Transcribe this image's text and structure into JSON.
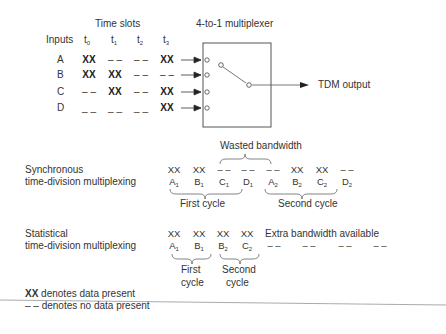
{
  "top": {
    "time_slots_label": "Time slots",
    "inputs_label": "Inputs",
    "mux_label": "4-to-1 multiplexer",
    "output_label": "TDM output",
    "slots": [
      {
        "base": "t",
        "sub": "0"
      },
      {
        "base": "t",
        "sub": "1"
      },
      {
        "base": "t",
        "sub": "2"
      },
      {
        "base": "t",
        "sub": "3"
      }
    ],
    "rows": [
      {
        "input": "A",
        "cells": [
          "XX",
          "– –",
          "– –",
          "XX"
        ]
      },
      {
        "input": "B",
        "cells": [
          "XX",
          "XX",
          "– –",
          "– –"
        ]
      },
      {
        "input": "C",
        "cells": [
          "– –",
          "XX",
          "– –",
          "XX"
        ]
      },
      {
        "input": "D",
        "cells": [
          "_ _",
          "_ _",
          "_ _",
          "XX"
        ]
      }
    ]
  },
  "sync": {
    "label_line1": "Synchronous",
    "label_line2": "time-division multiplexing",
    "wasted_label": "Wasted bandwidth",
    "slots": [
      {
        "data": "XX",
        "base": "A",
        "sub": "1"
      },
      {
        "data": "XX",
        "base": "B",
        "sub": "1"
      },
      {
        "data": "– –",
        "base": "C",
        "sub": "1"
      },
      {
        "data": "– –",
        "base": "D",
        "sub": "1"
      },
      {
        "data": "– –",
        "base": "A",
        "sub": "2"
      },
      {
        "data": "XX",
        "base": "B",
        "sub": "2"
      },
      {
        "data": "XX",
        "base": "C",
        "sub": "2"
      },
      {
        "data": "– –",
        "base": "D",
        "sub": "2"
      }
    ],
    "first_cycle": "First cycle",
    "second_cycle": "Second cycle"
  },
  "stat": {
    "label_line1": "Statistical",
    "label_line2": "time-division multiplexing",
    "slots": [
      {
        "data": "XX",
        "base": "A",
        "sub": "1"
      },
      {
        "data": "XX",
        "base": "B",
        "sub": "1"
      },
      {
        "data": "XX",
        "base": "B",
        "sub": "2"
      },
      {
        "data": "XX",
        "base": "C",
        "sub": "2"
      }
    ],
    "extra_label": "Extra bandwidth available",
    "extra_dashes": [
      "– –",
      "– –",
      "– –",
      "– –"
    ],
    "first_cycle_1": "First",
    "first_cycle_2": "cycle",
    "second_cycle_1": "Second",
    "second_cycle_2": "cycle"
  },
  "legend": {
    "xx_symbol": "XX",
    "xx_text": " denotes data present",
    "dash_symbol": "– –",
    "dash_text": " denotes no data present"
  }
}
